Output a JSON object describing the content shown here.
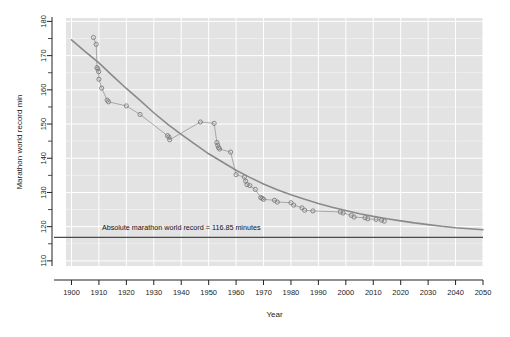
{
  "chart_data": {
    "type": "scatter",
    "title": "",
    "xlabel": "Year",
    "ylabel": "Marathon world record min",
    "xlim": [
      1898,
      2050
    ],
    "ylim": [
      108.5,
      181
    ],
    "xticks": [
      1900,
      1910,
      1920,
      1930,
      1940,
      1950,
      1960,
      1970,
      1980,
      1990,
      2000,
      2010,
      2020,
      2030,
      2040,
      2050
    ],
    "xtick_labels": [
      "1900",
      "1910",
      "1920",
      "1930",
      "1940",
      "1950",
      "1960",
      "1970",
      "1980",
      "1990",
      "2000",
      "2010",
      "2020",
      "2030",
      "2040",
      "2050"
    ],
    "yticks": [
      110,
      120,
      130,
      140,
      150,
      160,
      170,
      180
    ],
    "ytick_labels": [
      "110",
      "120",
      "130",
      "140",
      "150",
      "160",
      "170",
      "180"
    ],
    "yminor_ticks": [
      115,
      125,
      135,
      145,
      155,
      165,
      175
    ],
    "grid": true,
    "grid_color": "#ffffff",
    "panel_color": "#e3e3e3",
    "legend": null,
    "series": [
      {
        "name": "Marathon world records",
        "type": "scatter",
        "marker": "open-circle",
        "color": "#7d7d7d",
        "linked_by_line": true,
        "points": [
          [
            1908.0,
            175.3
          ],
          [
            1909.0,
            173.3
          ],
          [
            1909.3,
            166.5
          ],
          [
            1909.6,
            166.1
          ],
          [
            1909.9,
            165.3
          ],
          [
            1910.0,
            163.1
          ],
          [
            1911.0,
            160.5
          ],
          [
            1913.0,
            157.0
          ],
          [
            1913.5,
            156.5
          ],
          [
            1920.0,
            155.3
          ],
          [
            1925.0,
            152.8
          ],
          [
            1935.0,
            146.6
          ],
          [
            1935.5,
            146.2
          ],
          [
            1935.8,
            145.4
          ],
          [
            1947.0,
            150.6
          ],
          [
            1952.0,
            150.2
          ],
          [
            1953.0,
            144.6
          ],
          [
            1953.3,
            143.8
          ],
          [
            1953.6,
            143.1
          ],
          [
            1954.0,
            142.7
          ],
          [
            1958.0,
            141.8
          ],
          [
            1960.0,
            135.2
          ],
          [
            1963.0,
            134.5
          ],
          [
            1963.5,
            133.3
          ],
          [
            1964.0,
            132.3
          ],
          [
            1965.0,
            132.0
          ],
          [
            1967.0,
            130.9
          ],
          [
            1969.0,
            128.5
          ],
          [
            1969.5,
            128.3
          ],
          [
            1970.0,
            128.0
          ],
          [
            1974.0,
            127.7
          ],
          [
            1975.0,
            127.2
          ],
          [
            1980.0,
            127.0
          ],
          [
            1981.0,
            126.3
          ],
          [
            1984.0,
            125.5
          ],
          [
            1985.0,
            124.8
          ],
          [
            1988.0,
            124.6
          ],
          [
            1998.0,
            124.3
          ],
          [
            1999.0,
            124.0
          ],
          [
            2002.0,
            123.3
          ],
          [
            2003.0,
            122.8
          ],
          [
            2007.0,
            122.6
          ],
          [
            2008.0,
            122.3
          ],
          [
            2011.0,
            122.1
          ],
          [
            2013.0,
            121.9
          ],
          [
            2014.0,
            121.6
          ]
        ]
      },
      {
        "name": "Fitted exponential decay curve",
        "type": "line",
        "color": "#8a8a8a",
        "width": 1.6,
        "points": [
          [
            1900,
            174.6
          ],
          [
            1905,
            171.2
          ],
          [
            1910,
            167.9
          ],
          [
            1915,
            164.1
          ],
          [
            1920,
            160.4
          ],
          [
            1925,
            156.9
          ],
          [
            1930,
            153.3
          ],
          [
            1935,
            150.0
          ],
          [
            1940,
            147.0
          ],
          [
            1945,
            144.1
          ],
          [
            1950,
            141.3
          ],
          [
            1955,
            138.9
          ],
          [
            1960,
            136.5
          ],
          [
            1965,
            134.4
          ],
          [
            1970,
            132.5
          ],
          [
            1975,
            130.8
          ],
          [
            1980,
            129.3
          ],
          [
            1985,
            128.0
          ],
          [
            1990,
            126.8
          ],
          [
            1995,
            125.7
          ],
          [
            2000,
            124.7
          ],
          [
            2005,
            123.8
          ],
          [
            2010,
            123.0
          ],
          [
            2015,
            122.3
          ],
          [
            2020,
            121.7
          ],
          [
            2025,
            121.1
          ],
          [
            2030,
            120.6
          ],
          [
            2035,
            120.1
          ],
          [
            2040,
            119.7
          ],
          [
            2045,
            119.4
          ],
          [
            2050,
            119.1
          ]
        ]
      }
    ],
    "annotations": [
      {
        "name": "absolute-record-line",
        "type": "hline",
        "y": 116.85,
        "color": "#4a4a4a",
        "label": "Absolute marathon world record = 116.85 minutes",
        "label_x": 1940,
        "label_y": 119.0
      }
    ]
  }
}
